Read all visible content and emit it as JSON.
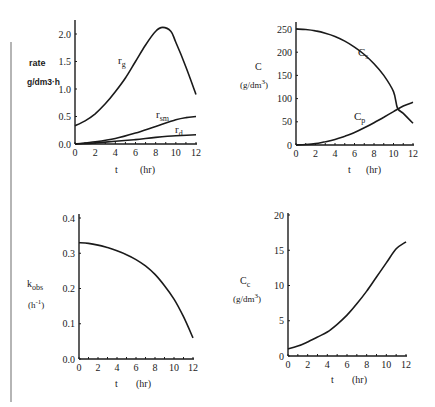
{
  "chart_data": [
    {
      "id": "rates",
      "type": "line",
      "title": "",
      "xlabel": "t (hr)",
      "ylabel": "rate g/dm3·h",
      "xlim": [
        0,
        12
      ],
      "ylim": [
        0,
        2.2
      ],
      "xticks": [
        0,
        2,
        4,
        6,
        8,
        10,
        12
      ],
      "yticks": [
        0.0,
        0.5,
        1.0,
        1.5,
        2.0
      ],
      "ytick_labels": [
        "0.0",
        "0.5",
        "1.0",
        "1.5",
        "2.0"
      ],
      "grid": false,
      "legend": "inline labels",
      "series": [
        {
          "name": "r_g",
          "label": "r",
          "sub": "g",
          "x": [
            0,
            1,
            2,
            3,
            4,
            5,
            6,
            7,
            8,
            8.7,
            9.5,
            10,
            11,
            12
          ],
          "values": [
            0.33,
            0.42,
            0.55,
            0.73,
            0.95,
            1.2,
            1.5,
            1.8,
            2.05,
            2.12,
            2.05,
            1.85,
            1.4,
            0.9
          ]
        },
        {
          "name": "r_sm",
          "label": "r",
          "sub": "sm",
          "x": [
            0,
            2,
            4,
            6,
            8,
            10,
            11,
            12
          ],
          "values": [
            0.0,
            0.04,
            0.1,
            0.2,
            0.32,
            0.44,
            0.48,
            0.5
          ]
        },
        {
          "name": "r_d",
          "label": "r",
          "sub": "d",
          "x": [
            0,
            2,
            4,
            6,
            8,
            10,
            12
          ],
          "values": [
            0.0,
            0.02,
            0.05,
            0.08,
            0.12,
            0.15,
            0.17
          ]
        }
      ]
    },
    {
      "id": "concentrations",
      "type": "line",
      "title": "",
      "xlabel": "t (hr)",
      "ylabel": "C (g/dm3)",
      "xlim": [
        0,
        12
      ],
      "ylim": [
        0,
        260
      ],
      "xticks": [
        0,
        2,
        4,
        6,
        8,
        10,
        12
      ],
      "yticks": [
        0,
        50,
        100,
        150,
        200,
        250
      ],
      "ytick_labels": [
        "0",
        "50",
        "100",
        "150",
        "200",
        "250"
      ],
      "grid": false,
      "legend": "inline labels",
      "series": [
        {
          "name": "C_s",
          "label": "C",
          "sub": "s",
          "x": [
            0,
            1,
            2,
            3,
            4,
            5,
            6,
            7,
            8,
            9,
            10,
            10.4,
            11,
            12
          ],
          "values": [
            250,
            249,
            246,
            241,
            234,
            224,
            211,
            195,
            175,
            150,
            115,
            80,
            68,
            47
          ]
        },
        {
          "name": "C_p",
          "label": "C",
          "sub": "p",
          "x": [
            0,
            1,
            2,
            3,
            4,
            5,
            6,
            7,
            8,
            9,
            10,
            11,
            12
          ],
          "values": [
            0,
            1,
            3,
            7,
            12,
            19,
            27,
            37,
            48,
            60,
            72,
            84,
            92
          ]
        }
      ]
    },
    {
      "id": "kobs",
      "type": "line",
      "title": "",
      "xlabel": "t (hr)",
      "ylabel": "k_obs (h^-1)",
      "xlim": [
        0,
        12
      ],
      "ylim": [
        0,
        0.4
      ],
      "xticks": [
        0,
        2,
        4,
        6,
        8,
        10,
        12
      ],
      "yticks": [
        0.0,
        0.1,
        0.2,
        0.3,
        0.4
      ],
      "ytick_labels": [
        "0.0",
        "0.1",
        "0.2",
        "0.3",
        "0.4"
      ],
      "grid": false,
      "series": [
        {
          "name": "k_obs",
          "x": [
            0,
            1,
            2,
            3,
            4,
            5,
            6,
            7,
            8,
            9,
            10,
            11,
            12
          ],
          "values": [
            0.33,
            0.328,
            0.323,
            0.316,
            0.307,
            0.296,
            0.282,
            0.264,
            0.24,
            0.208,
            0.17,
            0.12,
            0.06
          ]
        }
      ]
    },
    {
      "id": "cell-conc",
      "type": "line",
      "title": "",
      "xlabel": "t (hr)",
      "ylabel": "C_c (g/dm3)",
      "xlim": [
        0,
        12
      ],
      "ylim": [
        0,
        20
      ],
      "xticks": [
        0,
        2,
        4,
        6,
        8,
        10,
        12
      ],
      "yticks": [
        0,
        5,
        10,
        15,
        20
      ],
      "ytick_labels": [
        "0",
        "5",
        "10",
        "15",
        "20"
      ],
      "grid": false,
      "series": [
        {
          "name": "C_c",
          "x": [
            0,
            1,
            2,
            3,
            4,
            5,
            6,
            7,
            8,
            9,
            10,
            11,
            12
          ],
          "values": [
            1.0,
            1.4,
            2.0,
            2.7,
            3.4,
            4.5,
            5.8,
            7.4,
            9.2,
            11.2,
            13.2,
            15.2,
            16.2
          ]
        }
      ]
    }
  ],
  "panels": [
    {
      "ylabel_main": "rate",
      "ylabel_unit": "g/dm3·h",
      "xlabel_t": "t",
      "xlabel_unit": "(hr)",
      "labels": {
        "r_g": "g",
        "r_sm": "sm",
        "r_d": "d",
        "r": "r"
      }
    },
    {
      "ylabel_main": "C",
      "ylabel_unit_base": "(g/dm",
      "ylabel_unit_sup": "3",
      "ylabel_unit_close": ")",
      "xlabel_t": "t",
      "xlabel_unit": "(hr)",
      "labels": {
        "C": "C",
        "s": "s",
        "p": "p"
      }
    },
    {
      "ylabel_main": "k",
      "ylabel_sub": "obs",
      "ylabel_unit_base": "(h",
      "ylabel_unit_sup": "-1",
      "ylabel_unit_close": ")",
      "xlabel_t": "t",
      "xlabel_unit": "(hr)"
    },
    {
      "ylabel_main": "C",
      "ylabel_sub": "c",
      "ylabel_unit_base": "(g/dm",
      "ylabel_unit_sup": "3",
      "ylabel_unit_close": ")",
      "xlabel_t": "t",
      "xlabel_unit": "(hr)"
    }
  ],
  "style": {
    "line_color": "#1a1a1a",
    "margin_line_color": "#b5b5b5",
    "background": "#ffffff"
  }
}
